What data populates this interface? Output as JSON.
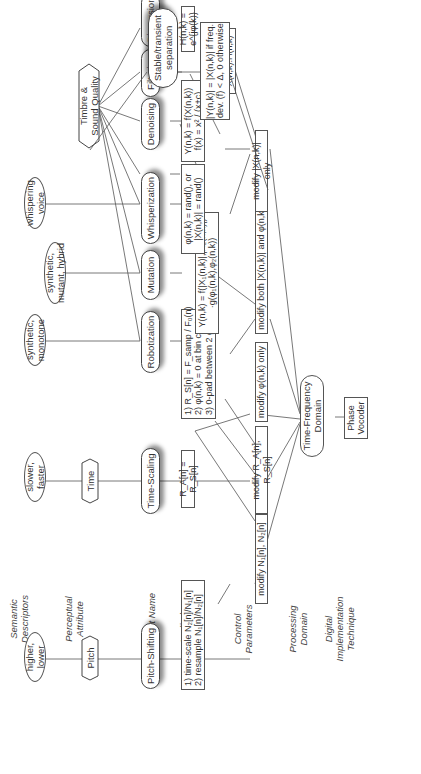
{
  "row_labels": {
    "semantic": "Semantic\nDescriptors",
    "perceptual": "Perceptual\nAttribute",
    "effect": "Effect Name",
    "applied": "Applied\nProcessing",
    "control": "Control\nParameters",
    "domain": "Processing\nDomain",
    "implementation": "Digital\nImplementation\nTechnique"
  },
  "semantic_descriptors": [
    {
      "id": "s1",
      "label": "higher,\nlower"
    },
    {
      "id": "s2",
      "label": "slower,\nfaster"
    },
    {
      "id": "s3",
      "label": "synthetic,\nmonotone"
    },
    {
      "id": "s4",
      "label": "synthetic,\nmutant, hybrid"
    },
    {
      "id": "s5",
      "label": "whispering\nvoice"
    }
  ],
  "perceptual_attributes": [
    {
      "id": "p1",
      "label": "Pitch"
    },
    {
      "id": "p2",
      "label": "Time"
    },
    {
      "id": "p3",
      "label": "Timbre &\nSound Quality"
    }
  ],
  "effects": [
    {
      "id": "e1",
      "label": "Pitch-Shifting"
    },
    {
      "id": "e2",
      "label": "Time-Scaling"
    },
    {
      "id": "e3",
      "label": "Robotization"
    },
    {
      "id": "e4",
      "label": "Mutation"
    },
    {
      "id": "e5",
      "label": "Whisperization"
    },
    {
      "id": "e6",
      "label": "Denoising"
    },
    {
      "id": "e7",
      "label": "Filtering"
    },
    {
      "id": "e8",
      "label": "Dispersion"
    },
    {
      "id": "e9",
      "label": "Stable/transient\nseparation"
    }
  ],
  "applied_processing": [
    {
      "id": "a1",
      "label": "1) time-scale N₂[n]/N₁[n]\n2) resample N₁[n]/N₂[n]"
    },
    {
      "id": "a2",
      "label": "R_A[n] = R_S[n]"
    },
    {
      "id": "a3",
      "label": "1) R_S[n] = F_samp / F₀(n)\n2) φ(n,k) = 0 at bin center\n3) 0-pad between 2 grains"
    },
    {
      "id": "a4",
      "label": "Y(n,k) = f(|X₁(n,k)|,|X₂(n,k)|)\n·g(φ₁(n,k),φ₂(n,k))"
    },
    {
      "id": "a5",
      "label": "φ(n,k) = rand(), or\n|X(n,k)| = rand()"
    },
    {
      "id": "a6",
      "label": "Y(n,k) = f(X(n,k))\nf(x) = x² / (x+c)"
    },
    {
      "id": "a7",
      "label": "Y(n,k) =\nX(n,k).H(n,k)"
    },
    {
      "id": "a8",
      "label": "H(n,k) = e^{jφ(k)}"
    },
    {
      "id": "a9",
      "label": "|Y(n,k)| = |X(n,k)| if freq.\ndev. (f) < Δ, 0 otherwise"
    }
  ],
  "control_parameters": [
    {
      "id": "c1",
      "label": "modify N₁[n], N₂[n]"
    },
    {
      "id": "c2",
      "label": "modify R_A[n], R_S[n]"
    },
    {
      "id": "c3",
      "label": "modify φ(n,k) only"
    },
    {
      "id": "c4",
      "label": "modify both |X(n,k)| and φ(n,k)"
    },
    {
      "id": "c5",
      "label": "modify |X(n,k)| only"
    }
  ],
  "processing_domain": {
    "label": "Time-Frequency\nDomain"
  },
  "implementation": {
    "label": "Phase\nVocoder"
  },
  "connections": [
    [
      "s1",
      "p1"
    ],
    [
      "p1",
      "e1"
    ],
    [
      "e1",
      "a1"
    ],
    [
      "a1",
      "c1"
    ],
    [
      "s2",
      "p2"
    ],
    [
      "p2",
      "e2"
    ],
    [
      "e2",
      "a2"
    ],
    [
      "a2",
      "c2"
    ],
    [
      "s3",
      "e3"
    ],
    [
      "s4",
      "e4"
    ],
    [
      "s5",
      "e5"
    ],
    [
      "p3",
      "e3"
    ],
    [
      "p3",
      "e4"
    ],
    [
      "p3",
      "e5"
    ],
    [
      "p3",
      "e6"
    ],
    [
      "p3",
      "e7"
    ],
    [
      "p3",
      "e8"
    ],
    [
      "p3",
      "e9"
    ],
    [
      "e3",
      "a3"
    ],
    [
      "e4",
      "a4"
    ],
    [
      "e5",
      "a5"
    ],
    [
      "e6",
      "a6"
    ],
    [
      "e7",
      "a7"
    ],
    [
      "e8",
      "a8"
    ],
    [
      "e9",
      "a9"
    ],
    [
      "a2",
      "c3"
    ],
    [
      "a3",
      "c2"
    ],
    [
      "a3",
      "c3"
    ],
    [
      "a4",
      "c4"
    ],
    [
      "a5",
      "c4"
    ],
    [
      "a6",
      "c5"
    ],
    [
      "a8",
      "a7"
    ],
    [
      "a7",
      "c5"
    ],
    [
      "a9",
      "c5"
    ],
    [
      "c1",
      "domain"
    ],
    [
      "c2",
      "domain"
    ],
    [
      "c3",
      "domain"
    ],
    [
      "c4",
      "domain"
    ],
    [
      "c5",
      "domain"
    ],
    [
      "domain",
      "impl"
    ]
  ]
}
